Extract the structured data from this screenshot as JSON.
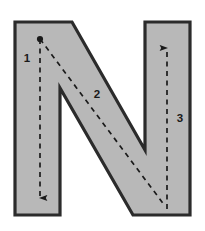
{
  "figure": {
    "kind": "letterform-stroke-order-diagram",
    "letter": "N",
    "background_color": "#ffffff",
    "letter_fill_color": "#b8b8b8",
    "letter_outline_color": "#2b2b2b",
    "stroke_path_color": "#1a1a1a",
    "label_color": "#1a1a1a"
  },
  "strokes": [
    {
      "number": "1",
      "name": "left-vertical-downstroke",
      "direction": "down",
      "start_marker": "dot",
      "end_marker": "arrowhead",
      "label_x": 27,
      "label_y": 62,
      "start_x": 40,
      "start_y": 39,
      "end_x": 40,
      "end_y": 204
    },
    {
      "number": "2",
      "name": "diagonal-downstroke",
      "direction": "down-right",
      "start_marker": "none",
      "end_marker": "none",
      "label_x": 97,
      "label_y": 98,
      "start_x": 40,
      "start_y": 39,
      "end_x": 165,
      "end_y": 206
    },
    {
      "number": "3",
      "name": "right-vertical-upstroke",
      "direction": "up",
      "start_marker": "none",
      "end_marker": "arrowhead",
      "label_x": 180,
      "label_y": 122,
      "start_x": 167,
      "start_y": 209,
      "end_x": 167,
      "end_y": 42
    }
  ],
  "letter_outline_points": "15,22 72,22 145,150 145,22 190,22 190,215 133,215 60,88 60,215 15,215"
}
